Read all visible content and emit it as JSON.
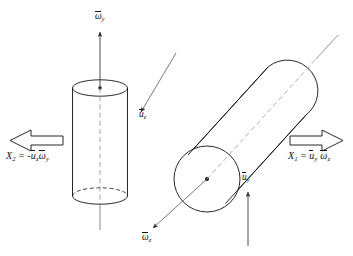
{
  "figure": {
    "type": "mechanics-diagram",
    "title": "",
    "background_color": "#ffffff",
    "stroke_color": "#111111",
    "dash_color": "#8a8a8a",
    "arrow_color": "#4a4a4a"
  },
  "labels": {
    "omega_y": {
      "symbol": "ω",
      "sub": "y",
      "overbar": true,
      "text": "ω̄y"
    },
    "u_z": {
      "symbol": "u",
      "sub": "z",
      "overbar": true,
      "text": "ūz"
    },
    "omega_z": {
      "symbol": "ω",
      "sub": "z",
      "overbar": true,
      "text": "ω̄z"
    },
    "u_y": {
      "symbol": "u",
      "sub": "y",
      "overbar": true,
      "text": "ūy"
    }
  },
  "equations": {
    "left": {
      "lhs": "X",
      "lhs_sub": "2",
      "eq": "=",
      "sign": "-",
      "factor1": "u",
      "factor1_sub": "z",
      "factor2": "ω",
      "factor2_sub": "y",
      "text": "X₂ = -ūzω̄y"
    },
    "right": {
      "lhs": "X",
      "lhs_sub": "1",
      "eq": "=",
      "sign": "",
      "factor1": "u",
      "factor1_sub": "y",
      "factor2": "ω",
      "factor2_sub": "z",
      "text": "X₁ = ūy ω̄z"
    }
  },
  "objects": {
    "left_cylinder": {
      "name": "vertical-cylinder",
      "orientation": "vertical",
      "has_center_dot": true,
      "axis_style": "dashed-inside-solid-outside"
    },
    "right_cylinder": {
      "name": "tilted-cylinder",
      "orientation": "tilted",
      "tilt_degrees": -35,
      "has_center_dot": true,
      "axis_style": "dashed-inside-solid-outside"
    },
    "left_block_arrow": {
      "name": "block-arrow-left",
      "direction": "left"
    },
    "right_block_arrow": {
      "name": "block-arrow-right",
      "direction": "right"
    }
  }
}
